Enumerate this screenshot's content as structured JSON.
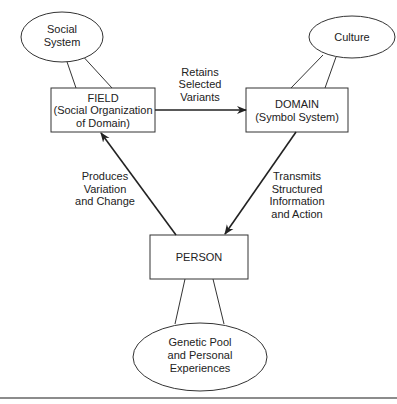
{
  "nodes": {
    "social_system": {
      "lines": [
        "Social",
        "System"
      ]
    },
    "culture": {
      "lines": [
        "Culture"
      ]
    },
    "field": {
      "lines": [
        "FIELD",
        "(Social Organization",
        "of Domain)"
      ]
    },
    "domain": {
      "lines": [
        "DOMAIN",
        "(Symbol System)"
      ]
    },
    "person": {
      "lines": [
        "PERSON"
      ]
    },
    "genetic_pool": {
      "lines": [
        "Genetic Pool",
        "and Personal",
        "Experiences"
      ]
    }
  },
  "edges": {
    "field_to_domain": {
      "lines": [
        "Retains",
        "Selected",
        "Variants"
      ]
    },
    "domain_to_person": {
      "lines": [
        "Transmits",
        "Structured",
        "Information",
        "and Action"
      ]
    },
    "person_to_field": {
      "lines": [
        "Produces",
        "Variation",
        "and Change"
      ]
    }
  },
  "colors": {
    "stroke": "#222222",
    "background": "#ffffff"
  }
}
